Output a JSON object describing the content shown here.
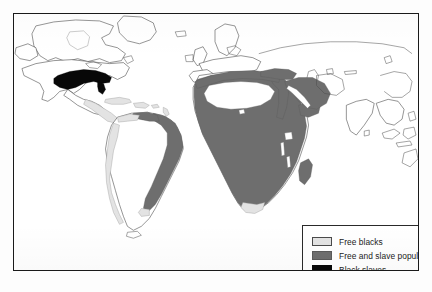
{
  "figure": {
    "type": "thematic-world-map",
    "title": "",
    "frame": {
      "x": 13,
      "y": 13,
      "width": 406,
      "height": 258,
      "border_color": "#1a1a1a"
    },
    "background_color": "#ffffff"
  },
  "legend": {
    "position": "bottom-right",
    "items": [
      {
        "label": "Free blacks",
        "color": "#e3e3e3",
        "swatch_name": "swatch-free-blacks"
      },
      {
        "label": "Free and slave population",
        "color": "#6e6e6e",
        "swatch_name": "swatch-free-and-slave"
      },
      {
        "label": "Black slaves",
        "color": "#080808",
        "swatch_name": "swatch-black-slaves"
      }
    ]
  },
  "map_regions": [
    {
      "name": "United States South",
      "category": "Black slaves",
      "color": "#080808",
      "continent": "North America"
    },
    {
      "name": "Central America and Caribbean coast",
      "category": "Free blacks",
      "color": "#e3e3e3",
      "continent": "North America"
    },
    {
      "name": "Caribbean islands",
      "category": "Free blacks",
      "color": "#e3e3e3",
      "continent": "North America"
    },
    {
      "name": "Northern South America coast",
      "category": "Free blacks",
      "color": "#e3e3e3",
      "continent": "South America"
    },
    {
      "name": "Brazil coastal belt",
      "category": "Free and slave population",
      "color": "#6e6e6e",
      "continent": "South America"
    },
    {
      "name": "Andean and Pacific coast",
      "category": "Free blacks",
      "color": "#e3e3e3",
      "continent": "South America"
    },
    {
      "name": "Rio de la Plata",
      "category": "Free blacks",
      "color": "#e3e3e3",
      "continent": "South America"
    },
    {
      "name": "Sub-Saharan Africa",
      "category": "Free and slave population",
      "color": "#6e6e6e",
      "continent": "Africa"
    },
    {
      "name": "North African coast and Maghreb",
      "category": "Free and slave population",
      "color": "#6e6e6e",
      "continent": "Africa"
    },
    {
      "name": "Sahara Desert",
      "category": "Unshaded",
      "color": "#ffffff",
      "continent": "Africa"
    },
    {
      "name": "Cape of Good Hope",
      "category": "Free blacks",
      "color": "#e3e3e3",
      "continent": "Africa"
    },
    {
      "name": "Madagascar",
      "category": "Free and slave population",
      "color": "#6e6e6e",
      "continent": "Africa"
    },
    {
      "name": "Arabian Peninsula and Red Sea",
      "category": "Free and slave population",
      "color": "#6e6e6e",
      "continent": "Asia"
    },
    {
      "name": "Nile Valley and Egypt",
      "category": "Free and slave population",
      "color": "#6e6e6e",
      "continent": "Africa"
    },
    {
      "name": "Anatolia and Levant",
      "category": "Free and slave population",
      "color": "#6e6e6e",
      "continent": "Asia"
    }
  ],
  "unshaded_regions": [
    "Canada",
    "Western United States",
    "Europe",
    "Russia",
    "Central Asia",
    "India",
    "China",
    "Southeast Asia",
    "Greenland",
    "Interior South America"
  ]
}
